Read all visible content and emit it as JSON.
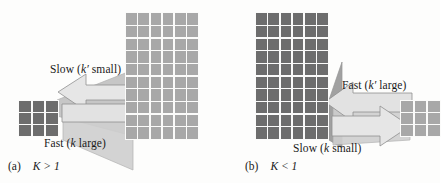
{
  "figure": {
    "type": "schematic-diagram",
    "background": "#fdfdfc",
    "colors": {
      "dark_cells": "#6d6d6d",
      "light_cells": "#a8a8a8",
      "arrow_fill": "#e2e2e2",
      "arrow_stroke": "#8c8c8c",
      "wedge_fill": "#bdbdbd",
      "text": "#1a1a1a"
    }
  },
  "panels": [
    {
      "id": "a",
      "caption_tag": "(a)",
      "caption_expr": "K > 1",
      "small_grid": {
        "name": "small-grid",
        "rows": 3,
        "cols": 3,
        "shade": "dark",
        "cell_count": 9,
        "side": "left"
      },
      "large_grid": {
        "name": "large-grid",
        "rows": 10,
        "cols": 6,
        "shade": "light",
        "cell_count": 60,
        "side": "right"
      },
      "arrows": [
        {
          "name": "slow-arrow",
          "label": "Slow (k′ small)",
          "label_prefix": "Slow (",
          "label_symbol": "k′",
          "label_suffix": " small)",
          "direction": "left",
          "style": "outline"
        },
        {
          "name": "fast-arrow",
          "label": "Fast (k large)",
          "label_prefix": "Fast (",
          "label_symbol": "k",
          "label_suffix": " large)",
          "direction": "right",
          "style": "filled"
        }
      ]
    },
    {
      "id": "b",
      "caption_tag": "(b)",
      "caption_expr": "K < 1",
      "large_grid": {
        "name": "large-grid",
        "rows": 10,
        "cols": 6,
        "shade": "dark",
        "cell_count": 60,
        "side": "left"
      },
      "small_grid": {
        "name": "small-grid",
        "rows": 3,
        "cols": 3,
        "shade": "light",
        "cell_count": 9,
        "side": "right"
      },
      "arrows": [
        {
          "name": "fast-arrow",
          "label": "Fast (k′ large)",
          "label_prefix": "Fast (",
          "label_symbol": "k′",
          "label_suffix": " large)",
          "direction": "left",
          "style": "filled"
        },
        {
          "name": "slow-arrow",
          "label": "Slow (k small)",
          "label_prefix": "Slow (",
          "label_symbol": "k",
          "label_suffix": " small)",
          "direction": "right",
          "style": "outline"
        }
      ]
    }
  ]
}
